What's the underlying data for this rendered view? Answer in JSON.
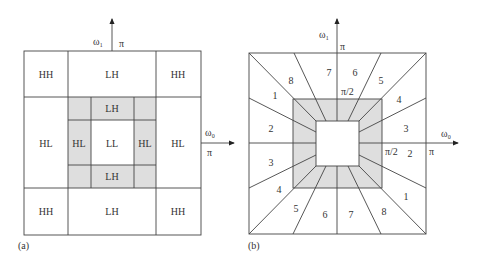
{
  "colors": {
    "line": "#444444",
    "shade": "#dedede",
    "text": "#333333"
  },
  "panel_a": {
    "caption": "(a)",
    "axis_v_label": "ω₁",
    "axis_v_tick": "π",
    "axis_h_label": "ω₀",
    "axis_h_tick": "π",
    "cells": {
      "top_left": "HH",
      "top_mid": "LH",
      "top_right": "HH",
      "mid_left": "HL",
      "inner_left": "HL",
      "center": "LL",
      "inner_right": "HL",
      "mid_right": "HL",
      "inner_top": "LH",
      "inner_bottom": "LH",
      "bot_left": "HH",
      "bot_mid": "LH",
      "bot_right": "HH"
    }
  },
  "panel_b": {
    "caption": "(b)",
    "axis_v_label": "ω₁",
    "axis_v_tick": "π",
    "axis_v_half": "π/2",
    "axis_h_label": "ω₀",
    "axis_h_tick": "π",
    "axis_h_half": "π/2",
    "top_numbers": [
      "8",
      "7",
      "6",
      "5"
    ],
    "bottom_numbers": [
      "5",
      "6",
      "7",
      "8"
    ],
    "left_numbers": [
      "1",
      "2",
      "3",
      "4"
    ],
    "right_numbers": [
      "4",
      "3",
      "2",
      "1"
    ]
  }
}
